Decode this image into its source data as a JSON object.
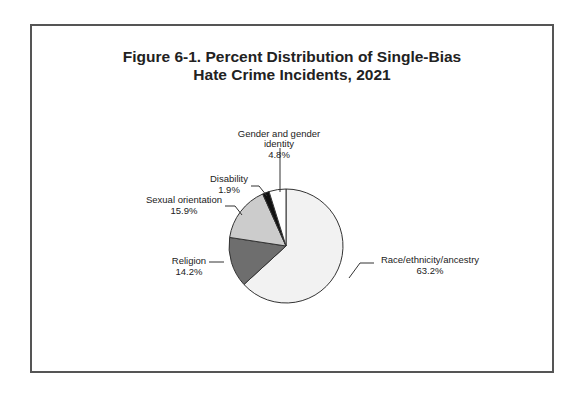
{
  "chart_data": {
    "type": "pie",
    "title": "Figure 6-1. Percent Distribution of Single-Bias Hate Crime Incidents, 2021",
    "title_lines": [
      "Figure 6-1. Percent Distribution of Single-Bias",
      "Hate Crime Incidents, 2021"
    ],
    "categories": [
      "Race/ethnicity/ancestry",
      "Religion",
      "Sexual orientation",
      "Disability",
      "Gender and gender identity"
    ],
    "values": [
      63.2,
      14.2,
      15.9,
      1.9,
      4.8
    ],
    "labels": [
      "63.2%",
      "14.2%",
      "15.9%",
      "1.9%",
      "4.8%"
    ],
    "colors": [
      "#f2f2f2",
      "#6e6e6e",
      "#cccccc",
      "#111111",
      "#ffffff"
    ],
    "legend": "none (callout labels)",
    "xlabel": "",
    "ylabel": ""
  },
  "labels": {
    "race": {
      "name": "Race/ethnicity/ancestry",
      "pct": "63.2%"
    },
    "religion": {
      "name": "Religion",
      "pct": "14.2%"
    },
    "sexual": {
      "name": "Sexual orientation",
      "pct": "15.9%"
    },
    "disability": {
      "name": "Disability",
      "pct": "1.9%"
    },
    "gender": {
      "name1": "Gender and gender",
      "name2": "identity",
      "pct": "4.8%"
    }
  }
}
